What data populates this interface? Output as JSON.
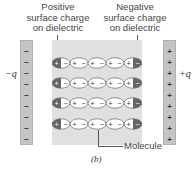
{
  "labels": {
    "positive_surface": [
      "Positive",
      "surface charge",
      "on dielectric"
    ],
    "negative_surface": [
      "Negative",
      "surface charge",
      "on dielectric"
    ],
    "minus_q": "−q",
    "plus_q": "+q",
    "molecule": "Molecule",
    "caption": "(b)"
  },
  "plates": {
    "left_sign": "−",
    "right_sign": "+",
    "sign_count": 9
  },
  "molecules": {
    "rows": 4,
    "per_row": 5,
    "pos_sign": "+",
    "neg_sign": "−"
  },
  "colors": {
    "plate": "#c4c4c4",
    "slab": "#e0e0e0",
    "molecule_fill": "#ffffff",
    "edge_shade": "#666666"
  }
}
